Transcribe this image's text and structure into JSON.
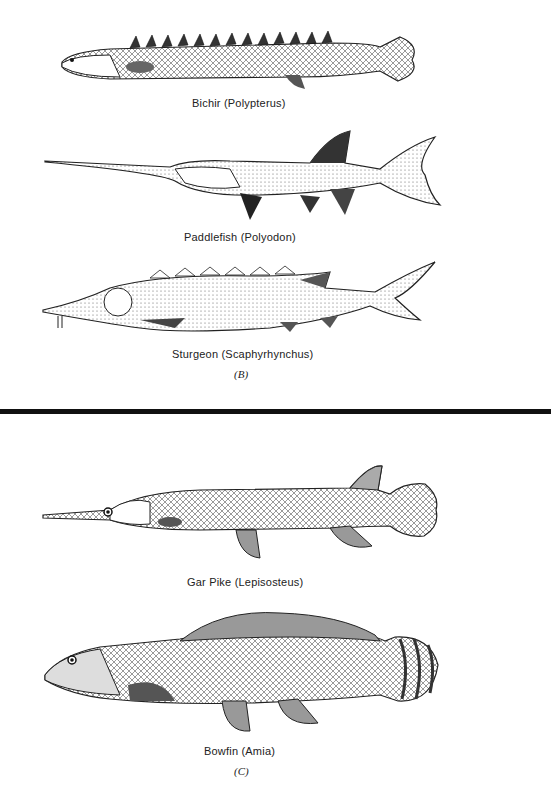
{
  "panels": [
    {
      "label": "(B)",
      "figures": [
        {
          "name": "bichir",
          "caption": "Bichir (Polypterus)"
        },
        {
          "name": "paddlefish",
          "caption": "Paddlefish (Polyodon)"
        },
        {
          "name": "sturgeon",
          "caption": "Sturgeon (Scaphyrhynchus)"
        }
      ]
    },
    {
      "label": "(C)",
      "figures": [
        {
          "name": "gar-pike",
          "caption": "Gar Pike (Lepisosteus)"
        },
        {
          "name": "bowfin",
          "caption": "Bowfin (Amia)"
        }
      ]
    }
  ]
}
